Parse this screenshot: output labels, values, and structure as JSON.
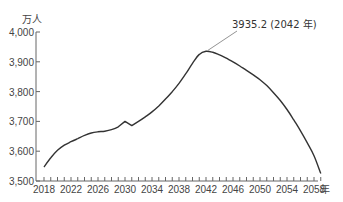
{
  "chart_data": {
    "type": "line",
    "title": "",
    "ylabel": "万人",
    "xlabel": "年",
    "ylim": [
      3500,
      4000
    ],
    "xlim": [
      2018,
      2059
    ],
    "grid": false,
    "legend": null,
    "y_ticks": [
      "3,500",
      "3,600",
      "3,700",
      "3,800",
      "3,900",
      "4,000"
    ],
    "x_ticks": [
      "2018",
      "2022",
      "2026",
      "2030",
      "2034",
      "2038",
      "2042",
      "2046",
      "2050",
      "2054",
      "2058"
    ],
    "series": [
      {
        "name": "population",
        "x": [
          2018,
          2019,
          2020,
          2021,
          2022,
          2023,
          2024,
          2025,
          2026,
          2027,
          2028,
          2029,
          2030,
          2031,
          2032,
          2033,
          2034,
          2035,
          2036,
          2037,
          2038,
          2039,
          2040,
          2041,
          2042,
          2043,
          2044,
          2045,
          2046,
          2047,
          2048,
          2049,
          2050,
          2051,
          2052,
          2053,
          2054,
          2055,
          2056,
          2057,
          2058,
          2059
        ],
        "values": [
          3547,
          3578,
          3603,
          3620,
          3632,
          3642,
          3653,
          3661,
          3665,
          3667,
          3672,
          3682,
          3700,
          3686,
          3700,
          3715,
          3732,
          3752,
          3775,
          3800,
          3828,
          3860,
          3895,
          3925,
          3935.2,
          3932,
          3923,
          3912,
          3900,
          3886,
          3871,
          3856,
          3840,
          3820,
          3796,
          3770,
          3740,
          3705,
          3668,
          3628,
          3585,
          3525
        ]
      }
    ],
    "annotations": [
      {
        "text": "3935.2 (2042 年)",
        "x": 2042,
        "y": 3935.2
      }
    ]
  }
}
